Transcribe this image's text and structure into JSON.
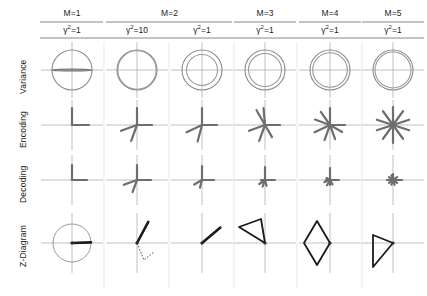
{
  "figure": {
    "row_labels": [
      "Variance",
      "Encoding",
      "Decoding",
      "Z-Diagram"
    ],
    "column_groups": [
      {
        "label": "M=1",
        "span": 1
      },
      {
        "label": "M=2",
        "span": 2
      },
      {
        "label": "M=3",
        "span": 1
      },
      {
        "label": "M=4",
        "span": 1
      },
      {
        "label": "M=5",
        "span": 1
      }
    ],
    "column_headers_m": [
      "M=1",
      "M=2",
      "M=3",
      "M=4",
      "M=5"
    ],
    "column_headers_gamma": [
      {
        "symbol": "γ",
        "exponent": "2",
        "eq": "=1"
      },
      {
        "symbol": "γ",
        "exponent": "2",
        "eq": "=10"
      },
      {
        "symbol": "γ",
        "exponent": "2",
        "eq": "=1"
      },
      {
        "symbol": "γ",
        "exponent": "2",
        "eq": "=1"
      },
      {
        "symbol": "γ",
        "exponent": "2",
        "eq": "=1"
      },
      {
        "symbol": "γ",
        "exponent": "2",
        "eq": "=1"
      }
    ],
    "colors": {
      "axis": "#b0b0b0",
      "circle_outer": "#8a8a8a",
      "circle_inner": "#9a9a9a",
      "vector_dark": "#6e6e6e",
      "z_line": "#1a1a1a",
      "rule": "#7a7a7a",
      "background": "#ffffff"
    }
  },
  "chart_data": {
    "type": "scatter",
    "xlabel": "",
    "ylabel": "",
    "grid": false,
    "legend": "none",
    "columns": [
      {
        "index": 0,
        "M": 1,
        "gamma_sq": 1
      },
      {
        "index": 1,
        "M": 2,
        "gamma_sq": 10
      },
      {
        "index": 2,
        "M": 2,
        "gamma_sq": 1
      },
      {
        "index": 3,
        "M": 3,
        "gamma_sq": 1
      },
      {
        "index": 4,
        "M": 4,
        "gamma_sq": 1
      },
      {
        "index": 5,
        "M": 5,
        "gamma_sq": 1
      }
    ],
    "rows": [
      {
        "name": "Variance",
        "description": "Unit prior circle with posterior variance ellipse/circle inside",
        "cells": [
          {
            "column": 0,
            "outer_r": 20,
            "inner_rx": 20,
            "inner_ry": 0.8,
            "shape": "flat-ellipse"
          },
          {
            "column": 1,
            "outer_r": 20,
            "inner_rx": 19.2,
            "inner_ry": 19.2,
            "shape": "near-coincident-circle"
          },
          {
            "column": 2,
            "outer_r": 20,
            "inner_rx": 15.5,
            "inner_ry": 15.5,
            "shape": "circle"
          },
          {
            "column": 3,
            "outer_r": 20,
            "inner_rx": 16.5,
            "inner_ry": 16.5,
            "shape": "circle"
          },
          {
            "column": 4,
            "outer_r": 20,
            "inner_rx": 17.3,
            "inner_ry": 17.3,
            "shape": "circle"
          },
          {
            "column": 5,
            "outer_r": 20,
            "inner_rx": 18.0,
            "inner_ry": 18.0,
            "shape": "circle"
          }
        ]
      },
      {
        "name": "Encoding",
        "description": "Encoding filter vectors radiating from origin; count grows with M",
        "cells": [
          {
            "column": 0,
            "n_vectors": 2,
            "angles_deg": [
              90,
              0
            ],
            "lengths": [
              17,
              17
            ]
          },
          {
            "column": 1,
            "n_vectors": 4,
            "angles_deg": [
              90,
              0,
              200,
              250
            ],
            "lengths": [
              17,
              15,
              17,
              17
            ]
          },
          {
            "column": 2,
            "n_vectors": 4,
            "angles_deg": [
              90,
              0,
              205,
              255
            ],
            "lengths": [
              17,
              15,
              17,
              17
            ]
          },
          {
            "column": 3,
            "n_vectors": 6,
            "angles_deg": [
              95,
              0,
              120,
              200,
              250,
              300
            ],
            "lengths": [
              17,
              15,
              17,
              17,
              17,
              14
            ]
          },
          {
            "column": 4,
            "n_vectors": 8,
            "angles_deg": [
              90,
              0,
              125,
              160,
              205,
              250,
              290,
              330
            ],
            "lengths": [
              17,
              15,
              16,
              16,
              17,
              16,
              15,
              14
            ]
          },
          {
            "column": 5,
            "n_vectors": 10,
            "angles_deg": [
              90,
              18,
              54,
              126,
              162,
              198,
              234,
              270,
              306,
              342
            ],
            "lengths": [
              18,
              17,
              17,
              17,
              17,
              17,
              17,
              18,
              17,
              17
            ]
          }
        ]
      },
      {
        "name": "Decoding",
        "description": "Decoding vectors radiating from origin; magnitude shrinks as M grows",
        "cells": [
          {
            "column": 0,
            "n_vectors": 2,
            "angles_deg": [
              90,
              0
            ],
            "lengths": [
              15,
              15
            ]
          },
          {
            "column": 1,
            "n_vectors": 4,
            "angles_deg": [
              90,
              0,
              200,
              250
            ],
            "lengths": [
              15,
              14,
              14,
              13
            ]
          },
          {
            "column": 2,
            "n_vectors": 4,
            "angles_deg": [
              90,
              0,
              210,
              255
            ],
            "lengths": [
              14,
              12,
              9,
              8
            ]
          },
          {
            "column": 3,
            "n_vectors": 6,
            "angles_deg": [
              90,
              0,
              215,
              250,
              285,
              180
            ],
            "lengths": [
              13,
              10,
              7,
              7,
              6,
              4
            ]
          },
          {
            "column": 4,
            "n_vectors": 8,
            "angles_deg": [
              90,
              0,
              200,
              240,
              270,
              300,
              180,
              150
            ],
            "lengths": [
              12,
              9,
              6,
              6,
              5,
              5,
              4,
              4
            ]
          },
          {
            "column": 5,
            "n_vectors": 10,
            "angles_deg": [
              90,
              0,
              36,
              144,
              180,
              216,
              252,
              288,
              324,
              108
            ],
            "lengths": [
              6,
              9,
              5,
              5,
              6,
              5,
              5,
              5,
              5,
              5
            ]
          }
        ]
      },
      {
        "name": "Z-Diagram",
        "description": "Z-diagram trajectory: circle+vector for M=1, polygon paths for larger M",
        "cells": [
          {
            "column": 0,
            "shape": "circle-with-vector",
            "circle_r": 19,
            "vector_angle_deg": 2,
            "vector_len": 19
          },
          {
            "column": 1,
            "shape": "vector-plus-dotted-v",
            "solid_angle_deg": 62,
            "solid_len": 24,
            "dotted_points": [
              [
                0,
                0
              ],
              [
                7,
                17
              ],
              [
                17,
                9
              ]
            ]
          },
          {
            "column": 2,
            "shape": "single-vector",
            "vector_angle_deg": 40,
            "vector_len": 24
          },
          {
            "column": 3,
            "shape": "triangle",
            "points": [
              [
                0,
                0
              ],
              [
                -26,
                16
              ],
              [
                -4,
                24
              ]
            ]
          },
          {
            "column": 4,
            "shape": "parallelogram",
            "points": [
              [
                0,
                0
              ],
              [
                -13,
                -22
              ],
              [
                -26,
                0
              ],
              [
                -13,
                22
              ]
            ]
          },
          {
            "column": 5,
            "shape": "narrow-triangle",
            "points": [
              [
                0,
                0
              ],
              [
                -20,
                -24
              ],
              [
                -20,
                8
              ]
            ]
          }
        ]
      }
    ]
  }
}
